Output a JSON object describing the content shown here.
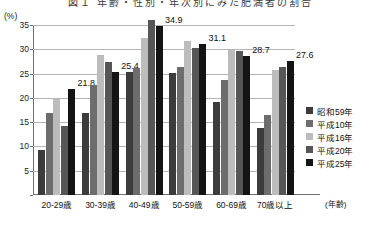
{
  "figure": {
    "title_clipped": "図１ 年齢・性別・年次別にみた肥満者の割合",
    "unit_label": "(%)",
    "x_axis_name": "(年齢)"
  },
  "chart_data": {
    "type": "bar",
    "title": "",
    "xlabel": "(年齢)",
    "ylabel": "(%)",
    "ylim": [
      0,
      35
    ],
    "yticks": [
      0,
      5,
      10,
      15,
      20,
      25,
      30,
      35
    ],
    "grid": true,
    "legend_position": "right",
    "categories": [
      "20-29歳",
      "30-39歳",
      "40-49歳",
      "50-59歳",
      "60-69歳",
      "70歳以上"
    ],
    "series": [
      {
        "name": "昭和59年",
        "color": "#3c3c3c",
        "values": [
          9.2,
          16.8,
          25.3,
          25.2,
          19.1,
          13.9
        ]
      },
      {
        "name": "平成10年",
        "color": "#6d6d6d",
        "values": [
          16.8,
          22.6,
          26.1,
          26.4,
          23.6,
          16.5
        ]
      },
      {
        "name": "平成16年",
        "color": "#bcbcbc",
        "values": [
          19.8,
          28.9,
          32.3,
          31.7,
          29.9,
          25.8
        ]
      },
      {
        "name": "平成20年",
        "color": "#565656",
        "values": [
          14.2,
          27.3,
          36.1,
          30.2,
          29.6,
          26.3
        ]
      },
      {
        "name": "平成25年",
        "color": "#141414",
        "values": [
          21.8,
          25.4,
          34.9,
          31.1,
          28.7,
          27.6
        ]
      }
    ],
    "data_labels": [
      {
        "category": "20-29歳",
        "series": "平成25年",
        "value": "21.8"
      },
      {
        "category": "30-39歳",
        "series": "平成25年",
        "value": "25.4"
      },
      {
        "category": "40-49歳",
        "series": "平成25年",
        "value": "34.9"
      },
      {
        "category": "50-59歳",
        "series": "平成25年",
        "value": "31.1"
      },
      {
        "category": "60-69歳",
        "series": "平成25年",
        "value": "28.7"
      },
      {
        "category": "70歳以上",
        "series": "平成25年",
        "value": "27.6"
      }
    ]
  }
}
